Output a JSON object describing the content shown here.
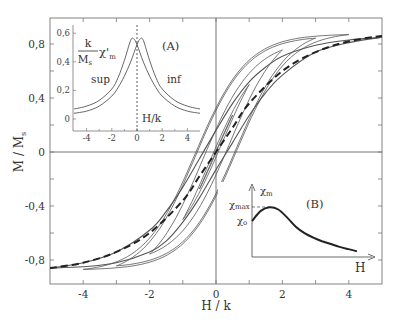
{
  "chart_data": [
    {
      "id": "main",
      "type": "line",
      "title": "",
      "xlabel": "H / k",
      "ylabel": "M / M_s",
      "ylabel_display": "M / Ms",
      "xlim": [
        -5,
        5
      ],
      "ylim": [
        -1.0,
        0.95
      ],
      "x_ticks": [
        -4,
        -2,
        0,
        2,
        4
      ],
      "x_tick_labels": [
        "-4",
        "-2",
        "0",
        "2",
        "4"
      ],
      "x_minor_ticks": [
        -3,
        -1,
        1,
        3
      ],
      "y_ticks": [
        -0.8,
        -0.4,
        0,
        0.4,
        0.8
      ],
      "y_tick_labels": [
        "-0,8",
        "-0,4",
        "0",
        "0,4",
        "0,8"
      ],
      "y_minor_ticks": [
        -0.6,
        -0.2,
        0.2,
        0.6
      ],
      "grid": false,
      "zero_lines": true,
      "series": [
        {
          "name": "major loop (upper branch)",
          "style": "solid",
          "x": [
            -5,
            -4,
            -3,
            -2,
            -1.5,
            -1,
            -0.5,
            0,
            0.5,
            1,
            1.5,
            2,
            3,
            4,
            5
          ],
          "y": [
            -0.86,
            -0.82,
            -0.74,
            -0.58,
            -0.44,
            -0.26,
            -0.05,
            0.16,
            0.36,
            0.52,
            0.63,
            0.71,
            0.79,
            0.83,
            0.85
          ]
        },
        {
          "name": "major loop (lower branch)",
          "style": "solid",
          "x": [
            -5,
            -4,
            -3,
            -2,
            -1.5,
            -1,
            -0.5,
            0,
            0.5,
            1,
            1.5,
            2,
            3,
            4,
            5
          ],
          "y": [
            -0.86,
            -0.85,
            -0.82,
            -0.74,
            -0.66,
            -0.52,
            -0.34,
            -0.13,
            0.07,
            0.27,
            0.44,
            0.57,
            0.74,
            0.81,
            0.85
          ]
        },
        {
          "name": "initial magnetization curve",
          "style": "dashed",
          "x": [
            -5,
            -4,
            -3,
            -2,
            -1,
            -0.5,
            0,
            0.5,
            1,
            2,
            3,
            4,
            5
          ],
          "y": [
            -0.86,
            -0.82,
            -0.74,
            -0.6,
            -0.36,
            -0.18,
            0,
            0.18,
            0.36,
            0.6,
            0.74,
            0.82,
            0.86
          ]
        },
        {
          "name": "minor loops",
          "style": "solid",
          "amplitudes_H": [
            0.5,
            1.0,
            2.0,
            3.0,
            4.0
          ]
        }
      ]
    },
    {
      "id": "inset_A",
      "type": "line",
      "label": "(A)",
      "xlabel": "H/k",
      "ylabel": "k/M_s χ'_m",
      "xlim": [
        -5,
        5
      ],
      "ylim": [
        -0.05,
        0.62
      ],
      "x_ticks": [
        -4,
        -2,
        0,
        2,
        4
      ],
      "x_tick_labels": [
        "-4",
        "-2",
        "0",
        "2",
        "4"
      ],
      "y_ticks": [
        0,
        0.2,
        0.4,
        0.6
      ],
      "y_tick_labels": [
        "0",
        "0,2",
        "0,4",
        "0,6"
      ],
      "vertical_dotted_line_at": 0,
      "series": [
        {
          "name": "sup",
          "x": [
            -5,
            -4,
            -3,
            -2,
            -1.5,
            -1,
            -0.5,
            -0.25,
            0,
            0.5,
            1,
            1.5,
            2,
            3,
            4,
            5
          ],
          "y": [
            0.07,
            0.09,
            0.13,
            0.21,
            0.29,
            0.41,
            0.55,
            0.56,
            0.52,
            0.4,
            0.3,
            0.22,
            0.16,
            0.09,
            0.055,
            0.04
          ]
        },
        {
          "name": "inf",
          "x": [
            -5,
            -4,
            -3,
            -2,
            -1.5,
            -1,
            -0.5,
            0,
            0.25,
            0.5,
            1,
            1.5,
            2,
            3,
            4,
            5
          ],
          "y": [
            0.04,
            0.055,
            0.09,
            0.16,
            0.22,
            0.3,
            0.4,
            0.52,
            0.56,
            0.55,
            0.41,
            0.29,
            0.21,
            0.13,
            0.09,
            0.07
          ]
        }
      ]
    },
    {
      "id": "inset_B",
      "type": "line",
      "label": "(B)",
      "xlabel": "H",
      "ylabel": "χm",
      "annotations": [
        "χmax",
        "χo"
      ],
      "series": [
        {
          "name": "χm(H)",
          "x": [
            0,
            0.5,
            1.0,
            1.5,
            2.0,
            2.5,
            3.0,
            3.5,
            4.0,
            4.5,
            5.0,
            5.5,
            6.0
          ],
          "y": [
            0.5,
            0.64,
            0.69,
            0.66,
            0.55,
            0.42,
            0.33,
            0.27,
            0.22,
            0.18,
            0.14,
            0.11,
            0.08
          ]
        }
      ]
    }
  ],
  "labels": {
    "x_axis": "H / k",
    "y_axis_main": "M / M",
    "y_axis_sub": "s",
    "insetA_tag": "(A)",
    "insetA_num": "k",
    "insetA_den": "M",
    "insetA_den_sub": "s",
    "insetA_chi": "χ'",
    "insetA_chi_sub": "m",
    "insetA_sup": "sup",
    "insetA_inf": "inf",
    "insetA_xlabel": "H/k",
    "insetB_tag": "(B)",
    "insetB_ylabel": "χ",
    "insetB_ylabel_sub": "m",
    "insetB_max": "χ",
    "insetB_max_sub": "max",
    "insetB_o": "χ",
    "insetB_o_sub": "o",
    "insetB_xlabel": "H"
  },
  "colors": {
    "line": "#555555",
    "dashed": "#222222",
    "axis": "#666666",
    "text": "#333333"
  }
}
